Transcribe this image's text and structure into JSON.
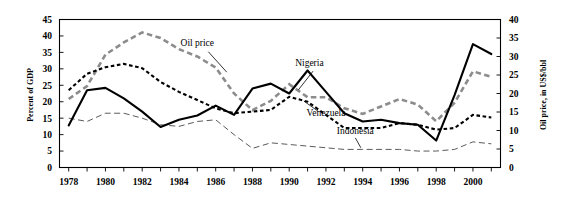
{
  "chart_data": {
    "type": "line",
    "title": "",
    "xlabel": "",
    "ylabel": "Percent of GDP",
    "y2label": "Oil price, in US$/bbl",
    "grid": false,
    "legend": "inline-annotations",
    "xlim": [
      1977.5,
      2001.5
    ],
    "ylim": [
      0,
      45
    ],
    "y2lim": [
      0,
      40
    ],
    "ytick_step": 5,
    "y2tick_step": 5,
    "x": [
      1978,
      1979,
      1980,
      1981,
      1982,
      1983,
      1984,
      1985,
      1986,
      1987,
      1988,
      1989,
      1990,
      1991,
      1992,
      1993,
      1994,
      1995,
      1996,
      1997,
      1998,
      1999,
      2000,
      2001
    ],
    "xticks": [
      1978,
      1979,
      1980,
      1981,
      1982,
      1983,
      1984,
      1985,
      1986,
      1987,
      1988,
      1989,
      1990,
      1991,
      1992,
      1993,
      1994,
      1995,
      1996,
      1997,
      1998,
      1999,
      2000,
      2001
    ],
    "xtick_labels": [
      "1978",
      "",
      "1980",
      "",
      "1982",
      "",
      "1984",
      "",
      "1986",
      "",
      "1988",
      "",
      "1990",
      "",
      "1992",
      "",
      "1994",
      "",
      "1996",
      "",
      "1998",
      "",
      "2000",
      ""
    ],
    "ytick_labels": [
      "0",
      "5",
      "10",
      "15",
      "20",
      "25",
      "30",
      "35",
      "40",
      "45"
    ],
    "y2tick_labels": [
      "0",
      "5",
      "10",
      "15",
      "20",
      "25",
      "30",
      "35",
      "40"
    ],
    "series": [
      {
        "name": "Oil price",
        "axis": "right",
        "unit": "US$/bbl",
        "color": "#8c8c8c",
        "style": "thick-dashed",
        "label_text": "Oil price",
        "values": [
          18.5,
          22.0,
          30.5,
          33.8,
          36.5,
          35.0,
          32.0,
          30.0,
          27.0,
          20.0,
          15.5,
          18.0,
          22.5,
          19.0,
          19.0,
          16.0,
          14.5,
          16.5,
          18.5,
          17.0,
          12.5,
          17.5,
          26.0,
          24.5
        ]
      },
      {
        "name": "Nigeria",
        "axis": "left",
        "unit": "Percent of GDP",
        "color": "#000000",
        "style": "solid",
        "label_text": "Nigeria",
        "values": [
          12.8,
          23.5,
          24.2,
          21.0,
          17.0,
          12.3,
          14.5,
          15.8,
          18.8,
          16.0,
          24.0,
          25.5,
          22.5,
          29.5,
          23.0,
          16.5,
          14.0,
          14.5,
          13.5,
          13.0,
          8.2,
          22.0,
          37.5,
          34.5
        ]
      },
      {
        "name": "Venezuela",
        "axis": "left",
        "unit": "Percent of GDP",
        "color": "#000000",
        "style": "dashed",
        "label_text": "Venezuela",
        "values": [
          23.5,
          28.5,
          30.5,
          31.5,
          30.2,
          26.0,
          23.0,
          20.5,
          18.0,
          16.5,
          17.0,
          17.5,
          21.5,
          20.0,
          16.0,
          12.0,
          12.0,
          12.0,
          13.5,
          13.0,
          11.5,
          12.0,
          16.0,
          15.2
        ]
      },
      {
        "name": "Indonesia",
        "axis": "left",
        "unit": "Percent of GDP",
        "color": "#5a5a5a",
        "style": "thin-dashed",
        "label_text": "Indonesia",
        "values": [
          15.0,
          14.0,
          16.5,
          16.5,
          15.0,
          13.0,
          12.5,
          14.0,
          14.5,
          10.0,
          5.8,
          7.5,
          7.0,
          6.5,
          6.0,
          5.5,
          5.5,
          5.5,
          5.5,
          5.0,
          5.0,
          5.5,
          7.8,
          7.2
        ]
      }
    ],
    "annotations": [
      {
        "text": "Oil price",
        "x": 1985.0,
        "y": 37.0
      },
      {
        "text": "Nigeria",
        "x": 1991.1,
        "y": 31.0
      },
      {
        "text": "Venezuela",
        "x": 1992.0,
        "y": 15.8
      },
      {
        "text": "Indonesia",
        "x": 1993.6,
        "y": 10.2
      }
    ]
  },
  "axes": {
    "left_title": "Percent of GDP",
    "right_title": "Oil price, in US$/bbl"
  }
}
